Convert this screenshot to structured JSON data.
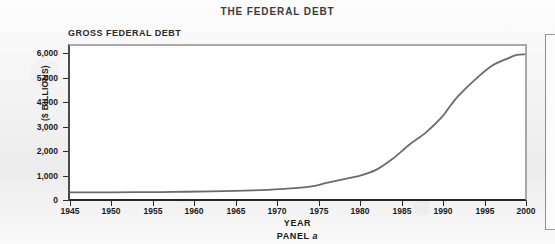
{
  "figure": {
    "title": "THE FEDERAL DEBT",
    "panel_title": "GROSS FEDERAL DEBT",
    "panel_caption_prefix": "PANEL",
    "panel_caption_letter": "a",
    "line_color": "#6b6b6b",
    "frame_color": "#262626",
    "plot_background": "#ffffff",
    "page_background": "#efefef"
  },
  "chart_data": {
    "type": "line",
    "title": "GROSS FEDERAL DEBT",
    "xlabel": "YEAR",
    "ylabel": "($ BILLIONS)",
    "xlim": [
      1945,
      2000
    ],
    "ylim": [
      0,
      6000
    ],
    "grid": false,
    "legend": null,
    "x_tick_labels": [
      "1945",
      "1950",
      "1955",
      "1960",
      "1965",
      "1970",
      "1975",
      "1980",
      "1985",
      "1990",
      "1995",
      "2000"
    ],
    "x_ticks": [
      1945,
      1950,
      1955,
      1960,
      1965,
      1970,
      1975,
      1980,
      1985,
      1990,
      1995,
      2000
    ],
    "y_tick_labels": [
      "0",
      "1,000",
      "2,000",
      "3,000",
      "4,000",
      "5,000",
      "6,000"
    ],
    "y_ticks": [
      0,
      1000,
      2000,
      3000,
      4000,
      5000,
      6000
    ],
    "series": [
      {
        "name": "Gross Federal Debt",
        "x": [
          1945,
          1947,
          1950,
          1953,
          1956,
          1959,
          1962,
          1965,
          1968,
          1971,
          1974,
          1976,
          1978,
          1980,
          1982,
          1984,
          1986,
          1988,
          1990,
          1991,
          1992,
          1994,
          1996,
          1998,
          1999,
          2000
        ],
        "values": [
          260,
          257,
          257,
          266,
          273,
          285,
          298,
          317,
          348,
          398,
          484,
          629,
          772,
          909,
          1142,
          1577,
          2125,
          2602,
          3233,
          3665,
          4065,
          4693,
          5225,
          5526,
          5656,
          5674
        ]
      }
    ]
  },
  "axis_geometry": {
    "y_tick_positions": [
      {
        "label": "0",
        "top": 200
      },
      {
        "label": "1,000",
        "top": 176
      },
      {
        "label": "2,000",
        "top": 151
      },
      {
        "label": "3,000",
        "top": 127
      },
      {
        "label": "4,000",
        "top": 102
      },
      {
        "label": "5,000",
        "top": 78
      },
      {
        "label": "6,000",
        "top": 53
      }
    ],
    "x_tick_positions": [
      {
        "label": "1945",
        "left": 70
      },
      {
        "label": "1950",
        "left": 111
      },
      {
        "label": "1955",
        "left": 153
      },
      {
        "label": "1960",
        "left": 194
      },
      {
        "label": "1965",
        "left": 236
      },
      {
        "label": "1970",
        "left": 277
      },
      {
        "label": "1975",
        "left": 319
      },
      {
        "label": "1980",
        "left": 360
      },
      {
        "label": "1985",
        "left": 402
      },
      {
        "label": "1990",
        "left": 443
      },
      {
        "label": "1995",
        "left": 485
      },
      {
        "label": "2000",
        "left": 526
      }
    ]
  }
}
